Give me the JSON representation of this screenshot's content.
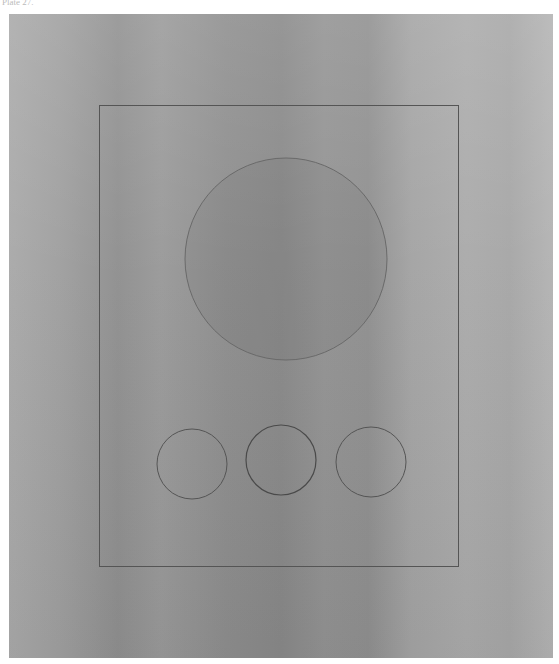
{
  "caption": "Plate 27.",
  "colors": {
    "line": "#5a5a5a",
    "paper": "#9a9a9a",
    "border": "#ffffff"
  },
  "figure": {
    "shapes": [
      "frame",
      "large-circle",
      "small-circle-left",
      "small-circle-center",
      "small-circle-right"
    ]
  }
}
